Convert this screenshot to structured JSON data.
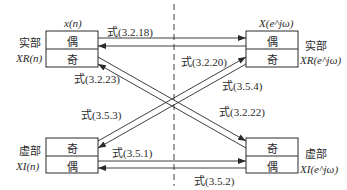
{
  "diagram": {
    "top_left_box": {
      "title": "x(n)",
      "side_label_1": "实部",
      "side_label_2": "XR(n)",
      "cells": [
        "偶",
        "奇"
      ]
    },
    "top_right_box": {
      "title": "X(e^jω)",
      "side_label_1": "实部",
      "side_label_2": "XR(e^jω)",
      "cells": [
        "偶",
        "奇"
      ]
    },
    "bottom_left_box": {
      "side_label_1": "虚部",
      "side_label_2": "XI(n)",
      "cells": [
        "奇",
        "偶"
      ]
    },
    "bottom_right_box": {
      "side_label_1": "虚部",
      "side_label_2": "XI(e^jω)",
      "cells": [
        "奇",
        "偶"
      ]
    },
    "arrows": [
      {
        "label": "式(3.2.18)",
        "from": "x(n) 偶",
        "to": "X(e^jω) 偶"
      },
      {
        "label": "式(3.2.20)",
        "from": "虚部 XI(n) 奇",
        "to": "X(e^jω) 奇"
      },
      {
        "label": "式(3.2.23)",
        "from": "X(e^jω) 实部 偶",
        "to": "x(n) 奇"
      },
      {
        "label": "式(3.5.4)",
        "from": "X(e^jω) 奇",
        "to": "XI(n) 奇"
      },
      {
        "label": "式(3.5.3)",
        "from": "X(e^jω) 奇",
        "to": "XI(n) 奇"
      },
      {
        "label": "式(3.2.22)",
        "from": "x(n) 奇",
        "to": "XI(e^jω) 奇"
      },
      {
        "label": "式(3.5.1)",
        "from": "XI(n) 偶",
        "to": "XI(e^jω) 偶"
      },
      {
        "label": "式(3.5.2)",
        "from": "XI(e^jω) 偶",
        "to": "XI(n) 偶"
      }
    ]
  }
}
